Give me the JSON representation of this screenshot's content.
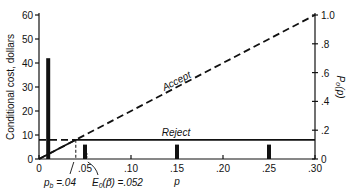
{
  "chart_data": {
    "type": "bar",
    "title": "",
    "xlabel": "p",
    "ylabel": "Conditional cost, dollars",
    "y2label": "P0(p)",
    "xlim": [
      0,
      0.3
    ],
    "ylim": [
      0,
      60
    ],
    "y2lim": [
      0,
      1.0
    ],
    "x_ticks": [
      "0",
      ".05",
      ".10",
      ".15",
      ".20",
      ".25",
      ".30"
    ],
    "y_ticks": [
      "0",
      "10",
      "20",
      "30",
      "40",
      "50",
      "60"
    ],
    "y2_ticks": [
      "0",
      ".2",
      ".4",
      ".6",
      ".8",
      "1.0"
    ],
    "grid": false,
    "bars": {
      "name": "P0(p)",
      "x": [
        0.01,
        0.05,
        0.15,
        0.25
      ],
      "values": [
        0.7,
        0.1,
        0.1,
        0.1
      ]
    },
    "series": [
      {
        "name": "Accept",
        "style": "dashed",
        "x": [
          0,
          0.3
        ],
        "values": [
          0,
          60
        ]
      },
      {
        "name": "Reject",
        "style": "solid",
        "x": [
          0,
          0.3
        ],
        "values": [
          8,
          8
        ]
      }
    ],
    "annotations": [
      {
        "text": "p_b = .04",
        "x": 0.04
      },
      {
        "text": "E0(p̃) = .052",
        "x": 0.052
      }
    ]
  },
  "labels": {
    "accept": "Accept",
    "reject": "Reject",
    "p": "p",
    "ylabel": "Conditional cost, dollars",
    "y2label": "P₀(p)",
    "pb": "p",
    "pb_sub": "b",
    "pb_val": " =.04",
    "e0": "E",
    "e0_sub": "0",
    "e0_val": "(p̃) =.052"
  }
}
